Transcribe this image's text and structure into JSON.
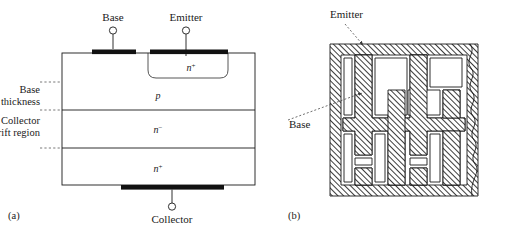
{
  "figure": {
    "panel_a": {
      "caption": "(a)",
      "terminals": [
        {
          "name": "base",
          "label": "Base"
        },
        {
          "name": "emitter",
          "label": "Emitter"
        },
        {
          "name": "collector",
          "label": "Collector"
        }
      ],
      "side_annotations": [
        {
          "name": "base-thickness",
          "line1": "Base",
          "line2": "thickness"
        },
        {
          "name": "collector-drift-region",
          "line1": "Collector",
          "line2": "drift region"
        }
      ],
      "layers": [
        {
          "name": "emitter-region",
          "doping": "n",
          "superscript": "+"
        },
        {
          "name": "base-region",
          "doping": "p",
          "superscript": ""
        },
        {
          "name": "drift-region",
          "doping": "n",
          "superscript": "−"
        },
        {
          "name": "substrate-region",
          "doping": "n",
          "superscript": "+"
        }
      ]
    },
    "panel_b": {
      "caption": "(b)",
      "labels": [
        {
          "name": "emitter",
          "label": "Emitter"
        },
        {
          "name": "base",
          "label": "Base"
        }
      ]
    }
  },
  "colors": {
    "line": "#1a1a1a",
    "contact": "#111111",
    "background": "#ffffff",
    "guide": "#555555"
  }
}
